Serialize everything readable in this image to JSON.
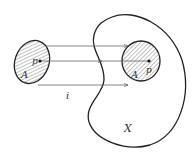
{
  "labels": {
    "left_A": "A",
    "left_p": "p",
    "right_A": "A",
    "right_p": "p",
    "map": "i",
    "space": "X"
  },
  "colors": {
    "stroke": "#222222",
    "hatch": "#555555",
    "arrow": "#666666"
  }
}
